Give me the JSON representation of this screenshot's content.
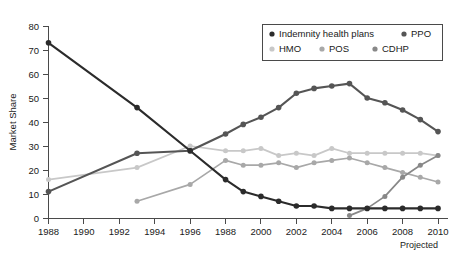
{
  "chart_data": {
    "type": "line",
    "title": "",
    "subtitle": "",
    "xlabel": "",
    "ylabel": "Market Share",
    "xlim": [
      1988,
      2010
    ],
    "ylim": [
      0,
      80
    ],
    "grid": false,
    "legend_position": "top-right",
    "y_ticks": [
      0,
      10,
      20,
      30,
      40,
      50,
      60,
      70,
      80
    ],
    "y_tick_labels": [
      "0",
      "10",
      "20",
      "30",
      "40",
      "50",
      "60",
      "70",
      "80"
    ],
    "x_ticks": [
      1988,
      1990,
      1992,
      1994,
      1996,
      1998,
      2000,
      2002,
      2004,
      2006,
      2008,
      2010
    ],
    "x_tick_labels": [
      "1988",
      "1990",
      "1992",
      "1994",
      "1996",
      "1988",
      "2000",
      "2002",
      "2004",
      "2006",
      "2008",
      "2010"
    ],
    "annotations": [
      {
        "text": "Projected",
        "x": 2010,
        "position": "below-axis-right"
      }
    ],
    "series": [
      {
        "name": "Indemnity health plans",
        "color": "#2b2b2b",
        "marker": "circle",
        "x": [
          1988,
          1993,
          1996,
          1998,
          1999,
          2000,
          2001,
          2002,
          2003,
          2004,
          2005,
          2006,
          2007,
          2008,
          2009,
          2010
        ],
        "values": [
          73,
          46,
          28,
          16,
          11,
          9,
          7,
          5,
          5,
          4,
          4,
          4,
          4,
          4,
          4,
          4
        ]
      },
      {
        "name": "PPO",
        "color": "#555555",
        "marker": "circle",
        "x": [
          1988,
          1993,
          1996,
          1998,
          1999,
          2000,
          2001,
          2002,
          2003,
          2004,
          2005,
          2006,
          2007,
          2008,
          2009,
          2010
        ],
        "values": [
          11,
          27,
          28,
          35,
          39,
          42,
          46,
          52,
          54,
          55,
          56,
          50,
          48,
          45,
          41,
          36
        ]
      },
      {
        "name": "HMO",
        "color": "#c8c8c8",
        "marker": "circle",
        "x": [
          1988,
          1993,
          1996,
          1998,
          1999,
          2000,
          2001,
          2002,
          2003,
          2004,
          2005,
          2006,
          2007,
          2008,
          2009,
          2010
        ],
        "values": [
          16,
          21,
          30,
          28,
          28,
          29,
          26,
          27,
          26,
          29,
          27,
          27,
          27,
          27,
          27,
          26
        ]
      },
      {
        "name": "POS",
        "color": "#a8a8a8",
        "marker": "circle",
        "x": [
          1993,
          1996,
          1998,
          1999,
          2000,
          2001,
          2002,
          2003,
          2004,
          2005,
          2006,
          2007,
          2008,
          2009,
          2010
        ],
        "values": [
          7,
          14,
          24,
          22,
          22,
          23,
          21,
          23,
          24,
          25,
          23,
          21,
          19,
          17,
          15
        ]
      },
      {
        "name": "CDHP",
        "color": "#888888",
        "marker": "circle",
        "x": [
          2005,
          2006,
          2007,
          2008,
          2009,
          2010
        ],
        "values": [
          1,
          4,
          9,
          17,
          22,
          26
        ]
      }
    ],
    "legend": [
      {
        "label": "Indemnity health plans",
        "color": "#2b2b2b"
      },
      {
        "label": "PPO",
        "color": "#555555"
      },
      {
        "label": "HMO",
        "color": "#c8c8c8"
      },
      {
        "label": "POS",
        "color": "#a8a8a8"
      },
      {
        "label": "CDHP",
        "color": "#888888"
      }
    ]
  }
}
